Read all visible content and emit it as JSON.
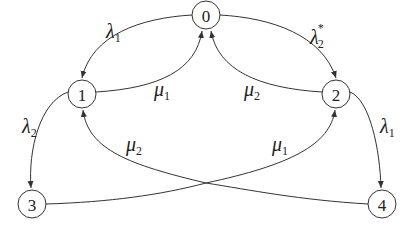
{
  "diagram": {
    "type": "state-transition-graph",
    "nodes": [
      {
        "id": "0",
        "label": "0",
        "x": 206,
        "y": 15
      },
      {
        "id": "1",
        "label": "1",
        "x": 82,
        "y": 94
      },
      {
        "id": "2",
        "label": "2",
        "x": 336,
        "y": 94
      },
      {
        "id": "3",
        "label": "3",
        "x": 32,
        "y": 204
      },
      {
        "id": "4",
        "label": "4",
        "x": 382,
        "y": 204
      }
    ],
    "edges": [
      {
        "from": "0",
        "to": "1",
        "label": "λ",
        "sub": "1",
        "sup": ""
      },
      {
        "from": "1",
        "to": "0",
        "label": "μ",
        "sub": "1",
        "sup": ""
      },
      {
        "from": "0",
        "to": "2",
        "label": "λ",
        "sub": "2",
        "sup": "*"
      },
      {
        "from": "2",
        "to": "0",
        "label": "μ",
        "sub": "2",
        "sup": ""
      },
      {
        "from": "1",
        "to": "3",
        "label": "λ",
        "sub": "2",
        "sup": ""
      },
      {
        "from": "4",
        "to": "1",
        "label": "μ",
        "sub": "2",
        "sup": ""
      },
      {
        "from": "2",
        "to": "4",
        "label": "λ",
        "sub": "1",
        "sup": ""
      },
      {
        "from": "3",
        "to": "2",
        "label": "μ",
        "sub": "1",
        "sup": ""
      }
    ]
  }
}
